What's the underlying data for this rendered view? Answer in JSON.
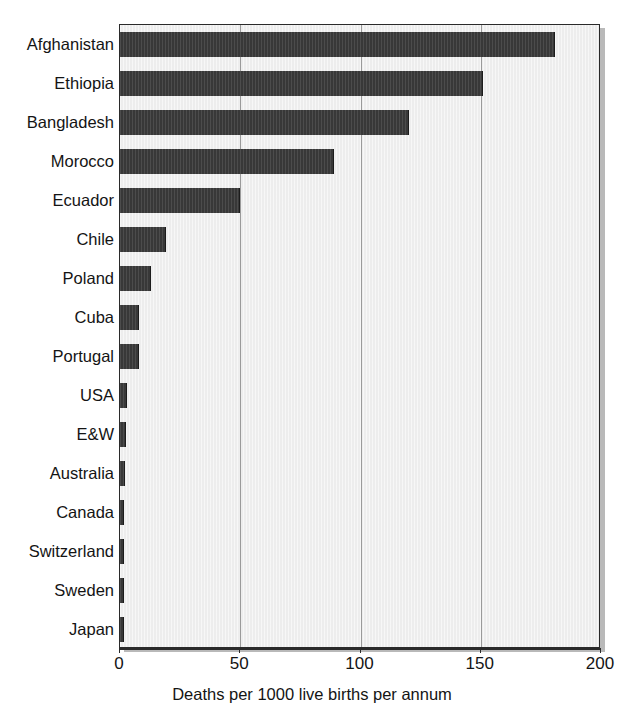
{
  "chart_data": {
    "type": "bar",
    "orientation": "horizontal",
    "title": "",
    "subtitle": "",
    "xlabel": "Deaths per 1000 live births per annum",
    "ylabel": "",
    "xlim": [
      0,
      200
    ],
    "xticks": [
      0,
      50,
      100,
      150,
      200
    ],
    "xticklabels": [
      "0",
      "50",
      "100",
      "150",
      "200"
    ],
    "grid": true,
    "grid_axis": "x",
    "legend": null,
    "categories": [
      "Afghanistan",
      "Ethiopia",
      "Bangladesh",
      "Morocco",
      "Ecuador",
      "Chile",
      "Poland",
      "Cuba",
      "Portugal",
      "USA",
      "E&W",
      "Australia",
      "Canada",
      "Switzerland",
      "Sweden",
      "Japan"
    ],
    "values": [
      181,
      151,
      120,
      89,
      50,
      19,
      13,
      8,
      8,
      3,
      2.5,
      2,
      1.5,
      1.5,
      1.5,
      1.5
    ],
    "bar_color": "#383838",
    "plot_background": "#ededed",
    "gridline_color": "#9a9a9a"
  },
  "axis": {
    "x_title": "Deaths per 1000 live births per annum",
    "tick_labels": [
      "0",
      "50",
      "100",
      "150",
      "200"
    ]
  }
}
